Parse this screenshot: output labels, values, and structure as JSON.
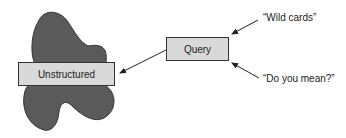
{
  "diagram": {
    "nodes": {
      "unstructured": {
        "label": "Unstructured"
      },
      "query": {
        "label": "Query"
      }
    },
    "annotations": {
      "wild_cards": {
        "label": "“Wild cards”"
      },
      "do_you_mean": {
        "label": "“Do you mean?”"
      }
    },
    "edges": [
      {
        "from": "query",
        "to": "unstructured"
      },
      {
        "from": "wild_cards",
        "to": "query"
      },
      {
        "from": "do_you_mean",
        "to": "query"
      }
    ],
    "colors": {
      "blob": "#5a5a5a",
      "box_fill": "#d9d9d9",
      "stroke": "#333333"
    }
  }
}
